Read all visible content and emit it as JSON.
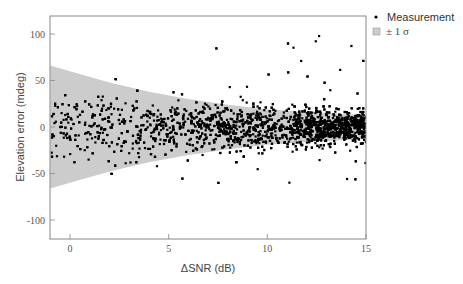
{
  "chart_data": {
    "type": "scatter",
    "title": "",
    "xlabel": "ΔSNR (dB)",
    "ylabel": "Elevation error (mdeg)",
    "xlim": [
      -1,
      15
    ],
    "ylim": [
      -120,
      120
    ],
    "xticks": [
      0,
      5,
      10,
      15
    ],
    "xtick_labels": [
      "0",
      "5",
      "10",
      "15"
    ],
    "yticks": [
      100,
      50,
      0,
      -50,
      -100
    ],
    "ytick_labels": [
      "100",
      "50",
      "0",
      "-50",
      "-100"
    ],
    "grid": false,
    "legend_position": "outside-top-right",
    "legend": [
      {
        "label": "Measurement",
        "marker": "dot",
        "color": "#000000"
      },
      {
        "label": "± 1 σ",
        "marker": "square",
        "color": "#cccccc"
      }
    ],
    "series": [
      {
        "name": "Measurement",
        "kind": "scatter",
        "color": "#000000",
        "description": "Dense cloud of ~2500 points; density increases with ΔSNR, heaviest between 12 and 15 dB; spread narrows with ΔSNR",
        "approx_point_count": 2500,
        "x_range": [
          -1,
          15
        ],
        "center_y": 0,
        "sigma_at_x": [
          {
            "x": -1,
            "sigma": 30
          },
          {
            "x": 5,
            "sigma": 24
          },
          {
            "x": 10,
            "sigma": 18
          },
          {
            "x": 15,
            "sigma": 14
          }
        ],
        "outlier_y_range": [
          -80,
          102
        ]
      },
      {
        "name": "± 1 σ",
        "kind": "band",
        "color": "#cccccc",
        "x": [
          -1,
          0,
          2,
          4,
          6,
          8,
          10,
          12,
          14,
          15
        ],
        "upper": [
          66,
          60,
          48,
          38,
          30,
          24,
          19,
          16,
          14,
          13
        ],
        "lower": [
          -66,
          -60,
          -48,
          -38,
          -30,
          -24,
          -19,
          -16,
          -14,
          -13
        ]
      }
    ]
  },
  "colors": {
    "frame": "#888888",
    "band": "#cccccc",
    "points": "#000000"
  }
}
